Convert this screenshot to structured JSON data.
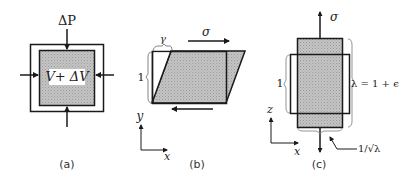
{
  "panels": {
    "a": {
      "caption": "(a)",
      "pressure_label": "ΔP",
      "volume_label": "V+ ΔV"
    },
    "b": {
      "caption": "(b)",
      "stress_label": "σ",
      "shear_label": "γ",
      "height_label": "1",
      "axis_y": "y",
      "axis_x": "x"
    },
    "c": {
      "caption": "(c)",
      "stress_label": "σ",
      "original_length_label": "1",
      "stretch_label": "λ = 1 + ϵ",
      "width_label": "1/√λ",
      "axis_z": "z",
      "axis_x": "x"
    }
  },
  "colors": {
    "fill": "#b8b8b8",
    "stroke": "#1a1a1a",
    "bracket": "#888888"
  }
}
